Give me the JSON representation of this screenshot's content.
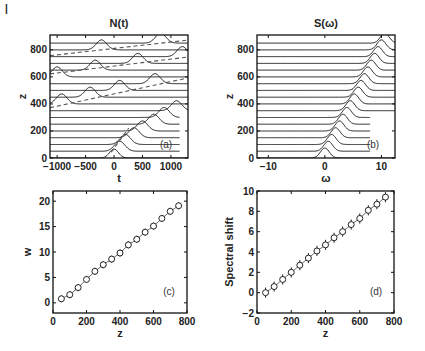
{
  "figure": {
    "corner_mark": "|"
  },
  "chart_data": [
    {
      "id": "a",
      "type": "line",
      "title": "N(t)",
      "xlabel": "t",
      "ylabel": "z",
      "panel_label": "(a)",
      "xlim": [
        -1125,
        1300
      ],
      "ylim": [
        0,
        910
      ],
      "xticks": [
        -1000,
        -500,
        0,
        500,
        1000
      ],
      "xtick_labels": [
        "-1000",
        "-500",
        "0",
        "500",
        "1000"
      ],
      "yticks": [
        0,
        200,
        400,
        600,
        800
      ],
      "ytick_labels": [
        "0",
        "200",
        "400",
        "600",
        "800"
      ],
      "description": "Waterfall of temporal intensity profiles N(t) stacked vs propagation distance z (baselines every 50). Soliton pulse drifts toward positive t and wraps around the time window; dashed line traces the soliton trajectory.",
      "baselines_z": [
        0,
        50,
        100,
        150,
        200,
        250,
        300,
        350,
        400,
        450,
        500,
        550,
        600,
        650,
        700,
        750,
        800,
        850
      ],
      "pulse_peak_t": [
        0,
        100,
        200,
        350,
        500,
        700,
        880,
        1100,
        -920,
        -420,
        100,
        720,
        -1000,
        -330,
        420,
        1200,
        -220,
        820
      ],
      "pulse_height": 10,
      "trajectory_dashed": {
        "z_start": 0,
        "z_end": 860,
        "note": "wrapping dashed trajectory lines"
      }
    },
    {
      "id": "b",
      "type": "line",
      "title": "S(ω)",
      "xlabel": "ω",
      "ylabel": "z",
      "panel_label": "(b)",
      "xlim": [
        -12,
        12.4
      ],
      "ylim": [
        0,
        910
      ],
      "xticks": [
        -10,
        0,
        10
      ],
      "xtick_labels": [
        "-10",
        "0",
        "10"
      ],
      "yticks": [
        0,
        200,
        400,
        600,
        800
      ],
      "ytick_labels": [
        "0",
        "200",
        "400",
        "600",
        "800"
      ],
      "description": "Waterfall of spectra S(ω) stacked vs z; spectral peak shifts linearly to higher ω.",
      "baselines_z": [
        0,
        50,
        100,
        150,
        200,
        250,
        300,
        350,
        400,
        450,
        500,
        550,
        600,
        650,
        700,
        750,
        800,
        850
      ],
      "peak_omega": [
        0,
        0.6,
        1.2,
        1.9,
        2.6,
        3.2,
        3.9,
        4.5,
        5.2,
        5.9,
        6.4,
        7.0,
        7.6,
        8.2,
        8.8,
        9.4,
        10.0,
        10.6
      ],
      "pulse_height": 10
    },
    {
      "id": "c",
      "type": "scatter",
      "title": "",
      "xlabel": "z",
      "ylabel": "w",
      "panel_label": "(c)",
      "xlim": [
        0,
        800
      ],
      "ylim": [
        -2,
        22
      ],
      "xticks": [
        0,
        200,
        400,
        600,
        800
      ],
      "xtick_labels": [
        "0",
        "200",
        "400",
        "600",
        "800"
      ],
      "yticks": [
        0,
        5,
        10,
        15,
        20
      ],
      "ytick_labels": [
        "0",
        "5",
        "10",
        "15",
        "20"
      ],
      "x": [
        50,
        100,
        150,
        200,
        250,
        300,
        350,
        400,
        450,
        500,
        550,
        600,
        650,
        700,
        750
      ],
      "values": [
        0.8,
        1.6,
        3.0,
        4.6,
        6.2,
        7.5,
        8.6,
        9.8,
        11.4,
        12.5,
        13.9,
        15.1,
        16.6,
        18.0,
        19.1
      ],
      "error": [
        0.7,
        0.7,
        0.7,
        0.7,
        0.7,
        0.7,
        0.7,
        0.7,
        0.7,
        0.7,
        0.7,
        0.7,
        0.7,
        0.7,
        0.7
      ],
      "marker": "open-circle-with-errorbar",
      "connected": true
    },
    {
      "id": "d",
      "type": "scatter",
      "title": "",
      "xlabel": "z",
      "ylabel": "Spectral shift",
      "panel_label": "(d)",
      "xlim": [
        0,
        800
      ],
      "ylim": [
        -2,
        10
      ],
      "xticks": [
        0,
        200,
        400,
        600,
        800
      ],
      "xtick_labels": [
        "0",
        "200",
        "400",
        "600",
        "800"
      ],
      "yticks": [
        -2,
        0,
        2,
        4,
        6,
        8,
        10
      ],
      "ytick_labels": [
        "-2",
        "0",
        "2",
        "4",
        "6",
        "8",
        "10"
      ],
      "x": [
        50,
        100,
        150,
        200,
        250,
        300,
        350,
        400,
        450,
        500,
        550,
        600,
        650,
        700,
        750
      ],
      "values": [
        0.0,
        0.6,
        1.3,
        2.0,
        2.7,
        3.4,
        4.1,
        4.7,
        5.4,
        6.0,
        6.7,
        7.3,
        8.1,
        8.7,
        9.4
      ],
      "error": [
        0.5,
        0.5,
        0.5,
        0.5,
        0.5,
        0.5,
        0.5,
        0.5,
        0.5,
        0.5,
        0.5,
        0.5,
        0.5,
        0.5,
        0.5
      ],
      "marker": "open-circle-with-errorbar",
      "connected": true
    }
  ],
  "layout": {
    "panels": {
      "a": {
        "left": 50,
        "top": 35,
        "right": 188,
        "bottom": 158
      },
      "b": {
        "left": 257,
        "top": 35,
        "right": 395,
        "bottom": 158
      },
      "c": {
        "left": 53,
        "top": 191,
        "right": 187,
        "bottom": 313
      },
      "d": {
        "left": 257,
        "top": 191,
        "right": 394,
        "bottom": 313
      }
    },
    "line_color": "#1a1a1a",
    "frame_color": "#111111",
    "dash_color": "#555555"
  }
}
